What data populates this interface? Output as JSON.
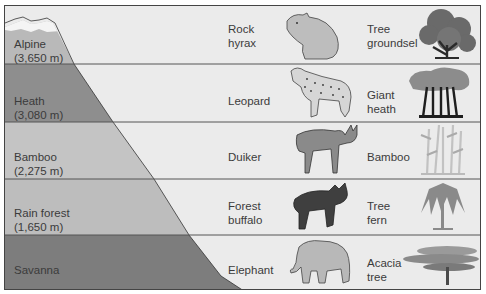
{
  "diagram": {
    "colors": {
      "background": "#ebebeb",
      "divider": "#555555",
      "snow": "#f4f4f4",
      "alpine": "#b9b9b9",
      "heath": "#8e8e8e",
      "bamboo": "#c4c4c4",
      "rain_forest": "#bdbdbd",
      "savanna": "#7d7d7d"
    },
    "zones": [
      {
        "name": "Alpine",
        "elevation": "(3,650 m)",
        "animal": "Rock",
        "animal2": "hyrax",
        "plant": "Tree",
        "plant2": "groundsel"
      },
      {
        "name": "Heath",
        "elevation": "(3,080 m)",
        "animal": "Leopard",
        "animal2": "",
        "plant": "Giant",
        "plant2": "heath"
      },
      {
        "name": "Bamboo",
        "elevation": "(2,275 m)",
        "animal": "Duiker",
        "animal2": "",
        "plant": "Bamboo",
        "plant2": ""
      },
      {
        "name": "Rain forest",
        "elevation": "(1,650 m)",
        "animal": "Forest",
        "animal2": "buffalo",
        "plant": "Tree",
        "plant2": "fern"
      },
      {
        "name": "Savanna",
        "elevation": "",
        "animal": "Elephant",
        "animal2": "",
        "plant": "Acacia",
        "plant2": "tree"
      }
    ],
    "icons": [
      "mountain-icon",
      "rock-hyrax-icon",
      "leopard-icon",
      "duiker-icon",
      "forest-buffalo-icon",
      "elephant-icon",
      "tree-groundsel-icon",
      "giant-heath-icon",
      "bamboo-icon",
      "tree-fern-icon",
      "acacia-tree-icon"
    ]
  }
}
